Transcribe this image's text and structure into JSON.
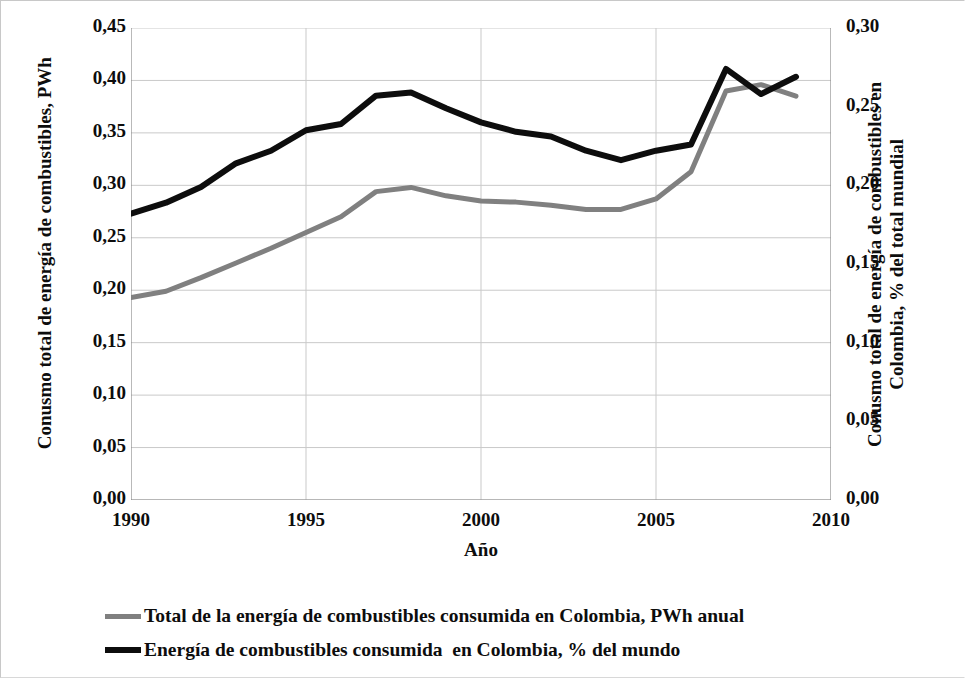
{
  "chart_data": {
    "type": "line",
    "title": "",
    "xlabel": "Año",
    "ylabel": "Conusmo total de energía de combustibles, PWh",
    "ylabel_right": "Conusmo total de energía de combustibles en\nColombia, % del total mundial",
    "x": [
      1990,
      1991,
      1992,
      1993,
      1994,
      1995,
      1996,
      1997,
      1998,
      1999,
      2000,
      2001,
      2002,
      2003,
      2004,
      2005,
      2006,
      2007,
      2008,
      2009
    ],
    "xlim": [
      1990,
      2010
    ],
    "xticks": [
      1990,
      1995,
      2000,
      2005,
      2010
    ],
    "xtick_labels": [
      "1990",
      "1995",
      "2000",
      "2005",
      "2010"
    ],
    "ylim": [
      0.0,
      0.45
    ],
    "yticks": [
      0.0,
      0.05,
      0.1,
      0.15,
      0.2,
      0.25,
      0.3,
      0.35,
      0.4,
      0.45
    ],
    "ytick_labels": [
      "0,00",
      "0,05",
      "0,10",
      "0,15",
      "0,20",
      "0,25",
      "0,30",
      "0,35",
      "0,40",
      "0,45"
    ],
    "ylim_right": [
      0.0,
      0.3
    ],
    "yticks_right": [
      0.0,
      0.05,
      0.1,
      0.15,
      0.2,
      0.25,
      0.3
    ],
    "ytick_labels_right": [
      "0,00",
      "0,05",
      "0,10",
      "0,15",
      "0,20",
      "0,25",
      "0,30"
    ],
    "grid": true,
    "legend_position": "below",
    "series": [
      {
        "name": "Total de la energía de combustibles consumida en Colombia, PWh anual",
        "axis": "left",
        "color": "#808080",
        "width": 5,
        "values": [
          0.193,
          0.199,
          0.212,
          0.226,
          0.24,
          0.255,
          0.27,
          0.294,
          0.298,
          0.29,
          0.285,
          0.284,
          0.281,
          0.277,
          0.277,
          0.287,
          0.313,
          0.39,
          0.396,
          0.385
        ]
      },
      {
        "name": "Energía de combustibles consumida  en Colombia, % del mundo",
        "axis": "right",
        "color": "#0d0d0d",
        "width": 6,
        "values": [
          0.182,
          0.189,
          0.199,
          0.214,
          0.222,
          0.235,
          0.239,
          0.257,
          0.259,
          0.249,
          0.24,
          0.234,
          0.231,
          0.222,
          0.216,
          0.222,
          0.226,
          0.274,
          0.258,
          0.269
        ]
      }
    ]
  },
  "legend": {
    "items": [
      {
        "label": "Total de la energía de combustibles consumida en Colombia, PWh anual",
        "swatch": "gray"
      },
      {
        "label": "Energía de combustibles consumida  en Colombia, % del mundo",
        "swatch": "black"
      }
    ]
  }
}
